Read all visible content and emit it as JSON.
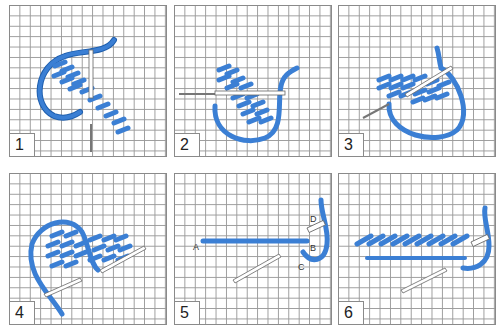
{
  "figure": {
    "thread_color": "#3b7fd4",
    "panels": [
      {
        "number": "1"
      },
      {
        "number": "2"
      },
      {
        "number": "3"
      },
      {
        "number": "4"
      },
      {
        "number": "5",
        "labels": [
          "A",
          "B",
          "C",
          "D"
        ]
      },
      {
        "number": "6"
      }
    ]
  }
}
